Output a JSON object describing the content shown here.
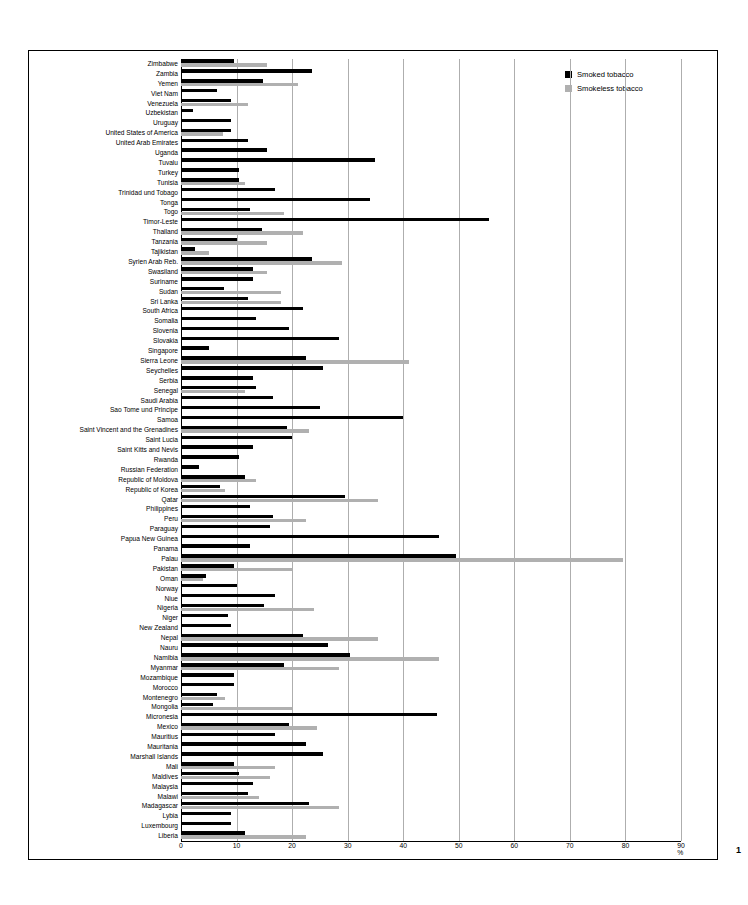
{
  "page": {
    "number": "1"
  },
  "legend": {
    "position": "top-right",
    "items": [
      {
        "label": "Smoked tobacco",
        "color": "#000000"
      },
      {
        "label": "Smokeless tobacco",
        "color": "#b0b0b0"
      }
    ]
  },
  "axis": {
    "x_unit": "%",
    "x_ticks": [
      "0",
      "10",
      "20",
      "30",
      "40",
      "50",
      "60",
      "70",
      "80",
      "90 %"
    ],
    "x_tick_values": [
      0,
      10,
      20,
      30,
      40,
      50,
      60,
      70,
      80,
      90
    ]
  },
  "chart_data": {
    "type": "bar",
    "orientation": "horizontal",
    "title": "",
    "subtitle": "",
    "xlabel": "%",
    "ylabel": "",
    "xlim": [
      0,
      90
    ],
    "grid": true,
    "legend_position": "top-right",
    "categories": [
      "Zimbabwe",
      "Zambia",
      "Yemen",
      "Viet Nam",
      "Venezuela",
      "Uzbekistan",
      "Uruguay",
      "United States of America",
      "United Arab Emirates",
      "Uganda",
      "Tuvalu",
      "Turkey",
      "Tunisia",
      "Trinidad und Tobago",
      "Tonga",
      "Togo",
      "Timor-Leste",
      "Thailand",
      "Tanzania",
      "Tajikistan",
      "Syrien Arab Reb.",
      "Swasiland",
      "Suriname",
      "Sudan",
      "Sri Lanka",
      "South Africa",
      "Somalia",
      "Slovenia",
      "Slovakia",
      "Singapore",
      "Sierra Leone",
      "Seychelles",
      "Serbia",
      "Senegal",
      "Saudi Arabia",
      "Sao Tome und Principe",
      "Samoa",
      "Saint Vincent and the Grenadines",
      "Saint Lucia",
      "Saint Kitts and Nevis",
      "Rwanda",
      "Russian Federation",
      "Republic of Moldova",
      "Republic of Korea",
      "Qatar",
      "Philippines",
      "Peru",
      "Paraguay",
      "Papua New Guinea",
      "Panama",
      "Palau",
      "Pakistan",
      "Oman",
      "Norway",
      "Niue",
      "Nigeria",
      "Niger",
      "New Zealand",
      "Nepal",
      "Nauru",
      "Namibia",
      "Myanmar",
      "Mozambique",
      "Morocco",
      "Montenegro",
      "Mongolia",
      "Micronesia",
      "Mexico",
      "Mauritius",
      "Mauritania",
      "Marshall Islands",
      "Mali",
      "Maldives",
      "Malaysia",
      "Malawi",
      "Madagascar",
      "Lybia",
      "Luxembourg",
      "Liberia"
    ],
    "series": [
      {
        "name": "Smoked tobacco",
        "color": "#000000",
        "values": [
          9.5,
          23.5,
          14.8,
          6.5,
          9.0,
          2.2,
          9.0,
          9.0,
          12.0,
          15.5,
          35.0,
          10.5,
          10.5,
          17.0,
          34.0,
          12.5,
          55.5,
          14.5,
          10.0,
          2.5,
          23.5,
          13.0,
          13.0,
          7.8,
          12.0,
          22.0,
          13.5,
          19.5,
          28.5,
          5.0,
          22.5,
          25.5,
          13.0,
          13.5,
          16.5,
          25.0,
          40.0,
          19.0,
          20.0,
          13.0,
          10.5,
          3.2,
          11.5,
          7.0,
          29.5,
          12.5,
          16.5,
          16.0,
          46.5,
          12.5,
          49.5,
          9.5,
          4.5,
          10.0,
          17.0,
          15.0,
          8.5,
          9.0,
          22.0,
          26.5,
          30.5,
          18.5,
          9.5,
          9.5,
          6.5,
          5.8,
          46.0,
          19.5,
          17.0,
          22.5,
          25.5,
          9.5,
          10.5,
          13.0,
          12.0,
          23.0,
          9.0,
          9.0,
          11.5
        ]
      },
      {
        "name": "Smokeless tobacco",
        "color": "#b0b0b0",
        "values": [
          15.5,
          0,
          21.0,
          0,
          12.0,
          0,
          0,
          7.5,
          0,
          0,
          0,
          0,
          11.5,
          0,
          0,
          18.5,
          0,
          22.0,
          15.5,
          5.0,
          29.0,
          15.5,
          0,
          18.0,
          18.0,
          0,
          0,
          0,
          0,
          0,
          41.0,
          0,
          0,
          11.5,
          0,
          0,
          0,
          23.0,
          0,
          0,
          0,
          0,
          13.5,
          8.0,
          35.5,
          0,
          22.5,
          0,
          0,
          0,
          79.5,
          20.0,
          4.0,
          0,
          0,
          24.0,
          0,
          0,
          35.5,
          0,
          46.5,
          28.5,
          0,
          0,
          8.0,
          20.0,
          0,
          24.5,
          0,
          0,
          0,
          17.0,
          16.0,
          0,
          14.0,
          28.5,
          0,
          0,
          22.5
        ]
      }
    ]
  }
}
